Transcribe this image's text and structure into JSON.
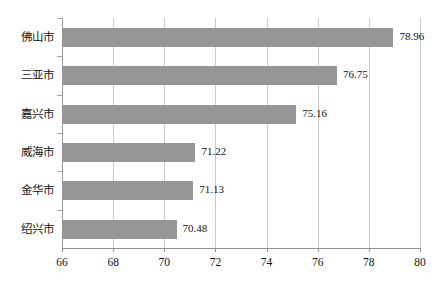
{
  "chart_data": {
    "type": "bar",
    "orientation": "horizontal",
    "title": "",
    "subtitle": "",
    "xlabel": "",
    "ylabel": "",
    "categories": [
      "佛山市",
      "三亚市",
      "嘉兴市",
      "威海市",
      "金华市",
      "绍兴市"
    ],
    "values": [
      78.96,
      76.75,
      75.16,
      71.22,
      71.13,
      70.48
    ],
    "value_labels": [
      "78.96",
      "76.75",
      "75.16",
      "71.22",
      "71.13",
      "70.48"
    ],
    "xlim": [
      66,
      80
    ],
    "xticks": [
      66,
      68,
      70,
      72,
      74,
      76,
      78,
      80
    ],
    "xtick_labels": [
      "66",
      "68",
      "70",
      "72",
      "74",
      "76",
      "78",
      "80"
    ],
    "grid": {
      "vertical": true,
      "horizontal": false
    },
    "legend": {
      "visible": false,
      "position": "none"
    },
    "colors": {
      "bar": "#969696",
      "gridline": "#c8c8c8",
      "axis": "#8f8f8f",
      "text": "#141414",
      "background": "#ffffff"
    }
  }
}
